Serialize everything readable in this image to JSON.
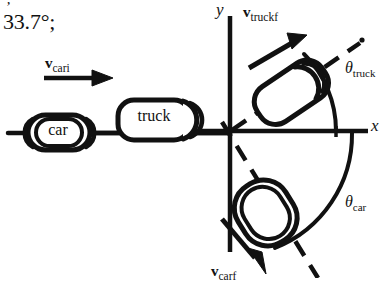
{
  "figure": {
    "note": {
      "tick_mark": "’",
      "angle_text": "33.7°;"
    },
    "axes": {
      "x_label": "x",
      "y_label": "y",
      "origin_x": 230,
      "origin_y": 130
    },
    "road": {
      "car_box_label": "car",
      "truck_box_label": "truck"
    },
    "vectors": [
      {
        "name": "v-cari",
        "symbol": "v",
        "subscript": "cari",
        "direction": "right",
        "description": "initial car velocity along +x"
      },
      {
        "name": "v-truckf",
        "symbol": "v",
        "subscript": "truckf",
        "direction": "upper-right",
        "description": "final truck velocity in quadrant I"
      },
      {
        "name": "v-carf",
        "symbol": "v",
        "subscript": "carf",
        "direction": "lower-right",
        "description": "final car velocity in quadrant IV"
      }
    ],
    "angles": [
      {
        "name": "theta-truck",
        "symbol": "θ",
        "subscript": "truck",
        "measured_from": "+x axis",
        "sense": "counterclockwise"
      },
      {
        "name": "theta-car",
        "symbol": "θ",
        "subscript": "car",
        "measured_from": "+x axis",
        "sense": "clockwise"
      }
    ],
    "colors": {
      "ink": "#111111",
      "background": "#ffffff"
    }
  }
}
